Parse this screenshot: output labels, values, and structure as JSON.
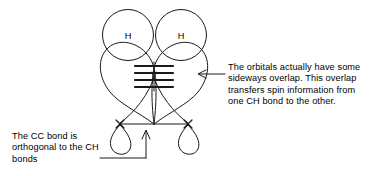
{
  "figure": {
    "background_color": "#ffffff",
    "stroke_color": "#1a1a1a"
  },
  "atoms": {
    "hydrogen_left_label": "H",
    "hydrogen_right_label": "H"
  },
  "annotations": {
    "right": {
      "text": "The orbitals actually have some sideways overlap. This overlap transfers spin information from one CH bond to the other.",
      "pointer": "arrow-left"
    },
    "left": {
      "text": "The CC bond is orthogonal to the CH bonds",
      "pointer": "arrow-up"
    }
  },
  "diagram_elements": {
    "overlap_bars_count": "4",
    "orbital_lobes_large": "2",
    "orbital_lobes_small": "2",
    "node_markers": "2",
    "cc_bond": "horizontal-line"
  }
}
